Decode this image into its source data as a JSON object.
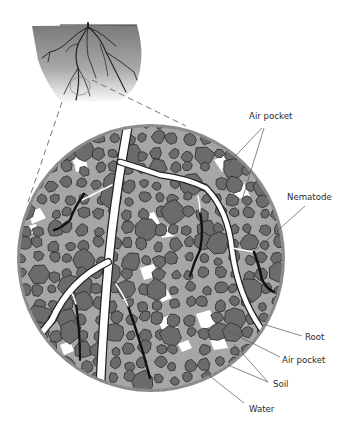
{
  "figure": {
    "inset": {
      "name": "soil-profile-with-root-system",
      "magnified_region": "root zone"
    },
    "labels": {
      "air_pocket_top": "Air pocket",
      "nematode": "Nematode",
      "root": "Root",
      "air_pocket_bottom": "Air pocket",
      "soil": "Soil",
      "water": "Water"
    },
    "colors": {
      "soil_particle": "#6b6b6b",
      "soil_particle_edge": "#333333",
      "water_film": "#a6a6a6",
      "air_pocket": "#ffffff",
      "root": "#ffffff",
      "root_edge": "#222222",
      "nematode": "#111111",
      "circle_rim": "#8c8c8c"
    }
  }
}
